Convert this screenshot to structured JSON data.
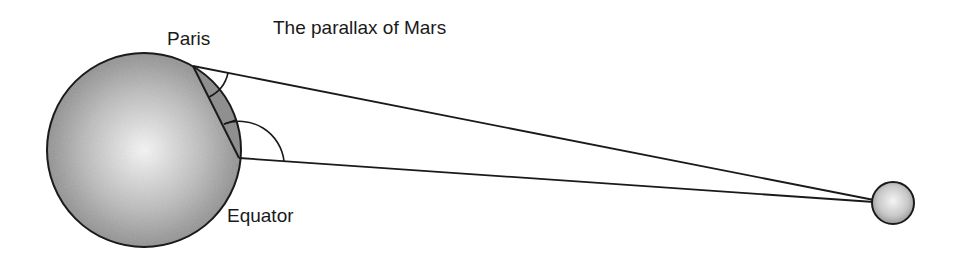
{
  "title": "The parallax of Mars",
  "labels": {
    "paris": "Paris",
    "equator": "Equator"
  },
  "colors": {
    "stroke": "#1a1a1a",
    "earth_center": "#f4f4f4",
    "earth_edge": "#8a8a8a",
    "cap_fill": "#8c8c8c",
    "mars_center": "#f2f2f2",
    "mars_edge": "#9a9a9a"
  }
}
